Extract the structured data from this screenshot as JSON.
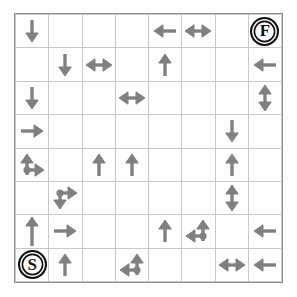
{
  "puzzle": {
    "title": "Arrow Grid Maze",
    "grid": {
      "rows": 8,
      "cols": 8
    },
    "colors": {
      "arrow": "#808080",
      "gridline": "#c9c9c9",
      "border": "#8e8e8e",
      "marker": "#111111",
      "background": "#ffffff"
    },
    "markers": {
      "start": {
        "label": "S",
        "row": 8,
        "col": 1,
        "name": "start-marker"
      },
      "finish": {
        "label": "F",
        "row": 1,
        "col": 8,
        "name": "finish-marker"
      }
    },
    "legend": {
      "up": "arrow-up",
      "down": "arrow-down",
      "left": "arrow-left",
      "right": "arrow-right",
      "left-right": "arrow-left-right",
      "up-down": "arrow-up-down",
      "up-right": "arrow-up-right-junction",
      "down-right": "arrow-down-right-junction",
      "up-left": "arrow-up-left-junction",
      "up-long": "arrow-up-long",
      "empty": "empty-cell"
    },
    "cells": [
      [
        "down",
        "empty",
        "empty",
        "empty",
        "left",
        "left-right",
        "empty",
        "finish"
      ],
      [
        "empty",
        "down",
        "left-right",
        "empty",
        "up",
        "empty",
        "empty",
        "left"
      ],
      [
        "down",
        "empty",
        "empty",
        "left-right",
        "empty",
        "empty",
        "empty",
        "up-down"
      ],
      [
        "right",
        "empty",
        "empty",
        "empty",
        "empty",
        "empty",
        "down",
        "empty"
      ],
      [
        "up-right",
        "empty",
        "up",
        "up",
        "empty",
        "empty",
        "up",
        "empty"
      ],
      [
        "empty",
        "down-right",
        "empty",
        "empty",
        "empty",
        "empty",
        "up-down",
        "empty"
      ],
      [
        "up-long",
        "right",
        "empty",
        "empty",
        "up",
        "up-left",
        "empty",
        "left"
      ],
      [
        "start",
        "up",
        "empty",
        "up-left",
        "empty",
        "empty",
        "left-right",
        "left"
      ]
    ]
  }
}
